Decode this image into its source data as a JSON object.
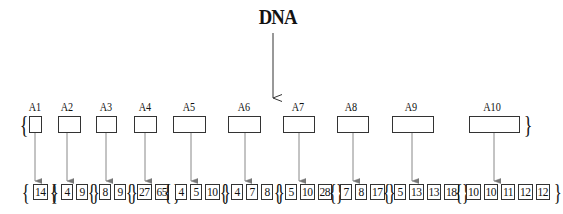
{
  "diagram": {
    "source_label": "DNA",
    "arrays": [
      {
        "label": "A1",
        "values": [
          "14"
        ]
      },
      {
        "label": "A2",
        "values": [
          "4",
          "9"
        ]
      },
      {
        "label": "A3",
        "values": [
          "8",
          "9"
        ]
      },
      {
        "label": "A4",
        "values": [
          "27",
          "65"
        ]
      },
      {
        "label": "A5",
        "values": [
          "4",
          "5",
          "10"
        ]
      },
      {
        "label": "A6",
        "values": [
          "4",
          "7",
          "8"
        ]
      },
      {
        "label": "A7",
        "values": [
          "5",
          "10",
          "28"
        ]
      },
      {
        "label": "A8",
        "values": [
          "7",
          "8",
          "17"
        ]
      },
      {
        "label": "A9",
        "values": [
          "5",
          "13",
          "13",
          "18"
        ]
      },
      {
        "label": "A10",
        "values": [
          "10",
          "10",
          "11",
          "12",
          "12"
        ]
      }
    ],
    "braces": {
      "open": "{",
      "close": "}"
    }
  }
}
